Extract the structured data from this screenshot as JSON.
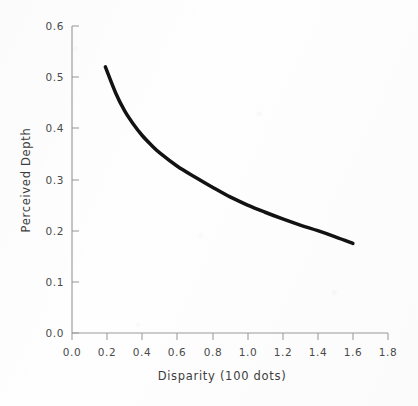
{
  "chart_data": {
    "type": "line",
    "title": "",
    "xlabel": "Disparity (100 dots)",
    "ylabel": "Perceived Depth",
    "xlim": [
      0.0,
      1.8
    ],
    "ylim": [
      0.0,
      0.6
    ],
    "grid": false,
    "legend": "none",
    "xticks": [
      "0.0",
      "0.2",
      "0.4",
      "0.6",
      "0.8",
      "1.0",
      "1.2",
      "1.4",
      "1.6",
      "1.8"
    ],
    "xtick_values": [
      0.0,
      0.2,
      0.4,
      0.6,
      0.8,
      1.0,
      1.2,
      1.4,
      1.6,
      1.8
    ],
    "yticks": [
      "0.6",
      "0.5",
      "0.4",
      "0.3",
      "0.2",
      "0.1",
      "0.0"
    ],
    "ytick_values": [
      0.6,
      0.5,
      0.4,
      0.3,
      0.2,
      0.1,
      0.0
    ],
    "series": [
      {
        "name": "Perceived Depth",
        "color": "#121212",
        "x": [
          0.19,
          0.25,
          0.3,
          0.35,
          0.4,
          0.45,
          0.5,
          0.6,
          0.7,
          0.8,
          0.9,
          1.0,
          1.1,
          1.2,
          1.3,
          1.4,
          1.5,
          1.6
        ],
        "values": [
          0.52,
          0.468,
          0.434,
          0.408,
          0.386,
          0.368,
          0.352,
          0.326,
          0.305,
          0.285,
          0.266,
          0.25,
          0.236,
          0.223,
          0.211,
          0.2,
          0.188,
          0.175
        ]
      }
    ]
  },
  "axes": {
    "x_title": "Disparity (100 dots)",
    "y_title": "Perceived Depth",
    "x_tick_labels": [
      "0.0",
      "0.2",
      "0.4",
      "0.6",
      "0.8",
      "1.0",
      "1.2",
      "1.4",
      "1.6",
      "1.8"
    ],
    "y_tick_labels": [
      "0.6",
      "0.5",
      "0.4",
      "0.3",
      "0.2",
      "0.1",
      "0.0"
    ],
    "axis_color": "#9a9a9a",
    "curve_color": "#121212",
    "text_color": "#4a4a4a"
  }
}
